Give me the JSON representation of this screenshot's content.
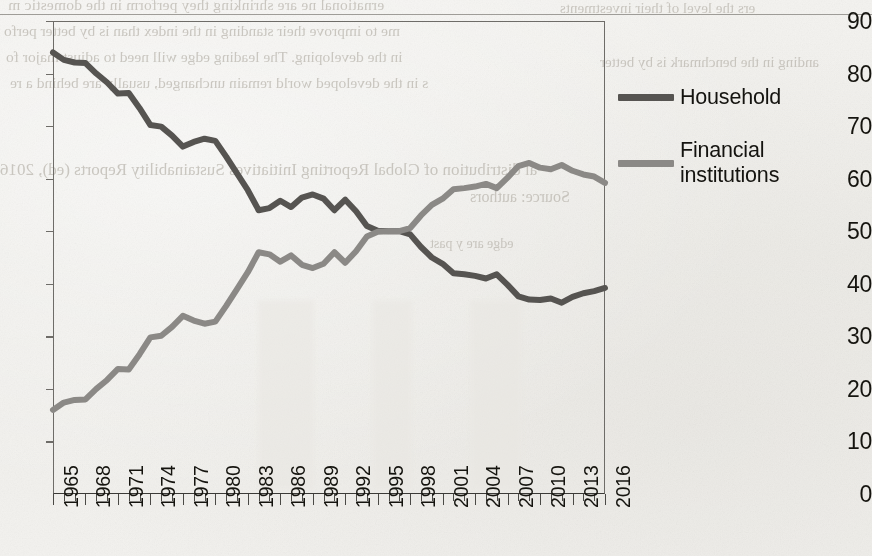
{
  "page": {
    "background_color": "#f2f1ee",
    "bleed_through_lines": [
      "ernational ne     are shrinking they perform in the domestic m",
      "me to improve their standing in the index than is by better perfo",
      "in the developing. The leading edge will need to adjust major fo",
      "s in the developed world remain unchanged, usually are behind a re",
      "al distribution of Global Reporting Initiatives Sustainability Reports (ed), 2016",
      "Source: authors",
      "ers the level of their investments",
      "anding in the benchmark is by better",
      "edge are y past"
    ]
  },
  "chart_data": {
    "type": "line",
    "title": "",
    "subtitle": "",
    "xlabel": "",
    "ylabel": "",
    "ylim": [
      0,
      90
    ],
    "ytick_step": 10,
    "yticks": [
      0,
      10,
      20,
      30,
      40,
      50,
      60,
      70,
      80,
      90
    ],
    "xlim": [
      1965,
      2016
    ],
    "xtick_labels": [
      "1965",
      "1968",
      "1971",
      "1974",
      "1977",
      "1980",
      "1983",
      "1986",
      "1989",
      "1992",
      "1995",
      "1998",
      "2001",
      "2004",
      "2007",
      "2010",
      "2013",
      "2016"
    ],
    "xtick_step": 3,
    "xtick_rotation": -90,
    "minor_xticks_yearly": true,
    "grid": false,
    "legend_position": "right",
    "x": [
      1965,
      1966,
      1967,
      1968,
      1969,
      1970,
      1971,
      1972,
      1973,
      1974,
      1975,
      1976,
      1977,
      1978,
      1979,
      1980,
      1981,
      1982,
      1983,
      1984,
      1985,
      1986,
      1987,
      1988,
      1989,
      1990,
      1991,
      1992,
      1993,
      1994,
      1995,
      1996,
      1997,
      1998,
      1999,
      2000,
      2001,
      2002,
      2003,
      2004,
      2005,
      2006,
      2007,
      2008,
      2009,
      2010,
      2011,
      2012,
      2013,
      2014,
      2015,
      2016
    ],
    "series": [
      {
        "name": "Household",
        "color": "#565451",
        "values": [
          84.0,
          82.6,
          82.1,
          82.0,
          80.0,
          78.3,
          76.2,
          76.3,
          73.4,
          70.2,
          69.9,
          68.2,
          66.1,
          67.0,
          67.6,
          67.2,
          64.2,
          61.0,
          57.8,
          54.0,
          54.4,
          55.8,
          54.6,
          56.4,
          57.0,
          56.2,
          54.0,
          56.0,
          53.8,
          51.0,
          50.1,
          50.0,
          50.0,
          49.4,
          47.0,
          45.0,
          43.8,
          42.0,
          41.8,
          41.5,
          41.0,
          41.8,
          39.8,
          37.6,
          37.0,
          36.9,
          37.2,
          36.4,
          37.5,
          38.2,
          38.6,
          39.2
        ]
      },
      {
        "name": "Financial institutions",
        "color": "#8b8986",
        "values": [
          16.0,
          17.4,
          17.9,
          18.0,
          20.0,
          21.7,
          23.8,
          23.7,
          26.6,
          29.8,
          30.1,
          31.8,
          33.9,
          33.0,
          32.4,
          32.8,
          35.8,
          39.0,
          42.2,
          46.0,
          45.6,
          44.2,
          45.4,
          43.6,
          43.0,
          43.8,
          46.0,
          44.0,
          46.2,
          49.0,
          49.9,
          50.0,
          50.0,
          50.6,
          53.0,
          55.0,
          56.2,
          58.0,
          58.2,
          58.5,
          59.0,
          58.2,
          60.2,
          62.4,
          63.0,
          62.1,
          61.8,
          62.6,
          61.5,
          60.8,
          60.4,
          59.2
        ]
      }
    ]
  },
  "legend": {
    "items": [
      {
        "label": "Household",
        "color": "#565451"
      },
      {
        "label": "Financial institutions",
        "color": "#8b8986"
      }
    ]
  }
}
